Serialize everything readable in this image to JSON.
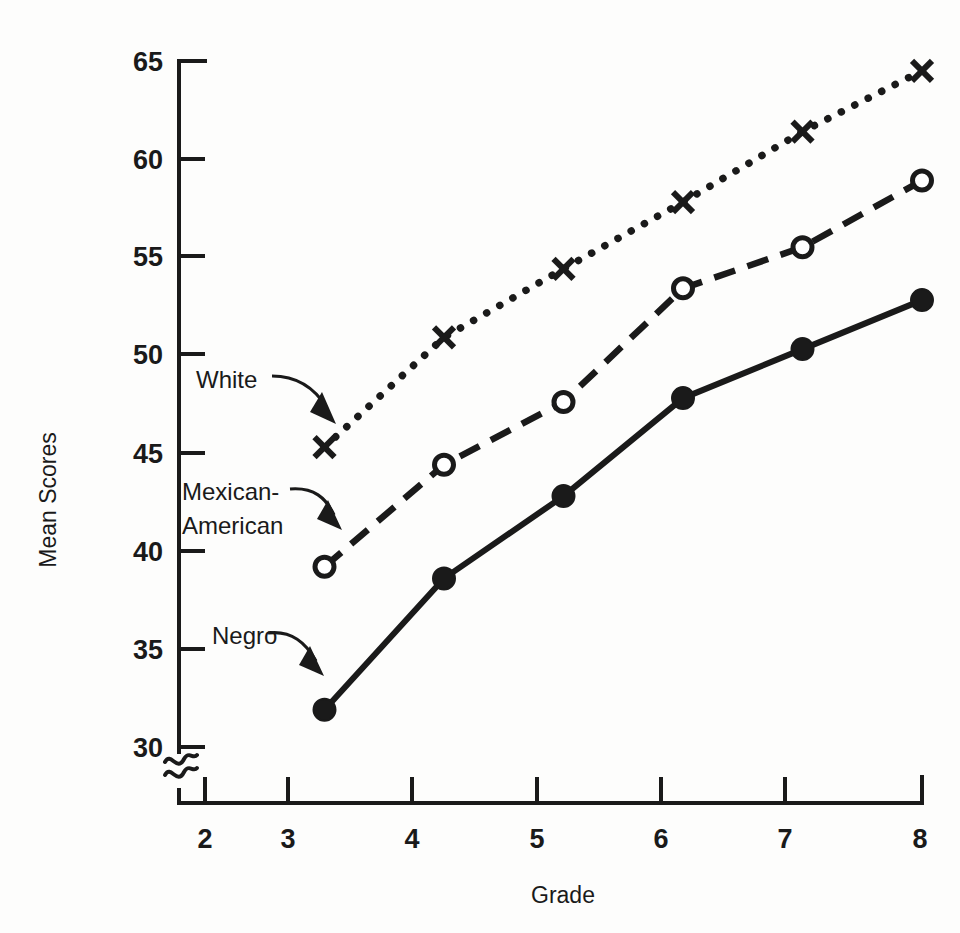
{
  "chart_data": {
    "type": "line",
    "title": "",
    "xlabel": "Grade",
    "ylabel": "Mean Scores",
    "x": [
      3,
      4,
      5,
      6,
      7,
      8
    ],
    "xticks": [
      "2",
      "3",
      "4",
      "5",
      "6",
      "7",
      "8"
    ],
    "xtick_values": [
      2,
      3,
      4,
      5,
      6,
      7,
      8
    ],
    "yticks": [
      "30",
      "35",
      "40",
      "45",
      "50",
      "55",
      "60",
      "65"
    ],
    "ytick_values": [
      30,
      35,
      40,
      45,
      50,
      55,
      60,
      65
    ],
    "xlim": [
      2,
      8
    ],
    "ylim": [
      28.6,
      66
    ],
    "grid": false,
    "legend": "inline-annotations",
    "y_axis_break": true,
    "y_axis_break_symbol": "≈",
    "series": [
      {
        "name": "White",
        "marker": "x-cross",
        "linestyle": "dotted",
        "color": "#1a1a1a",
        "values": [
          45.3,
          50.9,
          54.4,
          57.8,
          61.4,
          64.5
        ]
      },
      {
        "name": "Mexican-American",
        "marker": "open-circle",
        "linestyle": "dashed",
        "color": "#1a1a1a",
        "values": [
          39.2,
          44.4,
          47.6,
          53.4,
          55.5,
          58.9
        ]
      },
      {
        "name": "Negro",
        "marker": "filled-circle",
        "linestyle": "solid",
        "color": "#1a1a1a",
        "values": [
          31.9,
          38.6,
          42.8,
          47.8,
          50.3,
          52.8
        ]
      }
    ],
    "annotations": [
      {
        "text": "White",
        "series": "White",
        "label_x": 196,
        "label_y": 388
      },
      {
        "text": "Mexican-",
        "series": "Mexican-American",
        "label_x": 182,
        "label_y": 500
      },
      {
        "text": "American",
        "series": "Mexican-American",
        "label_x": 182,
        "label_y": 534
      },
      {
        "text": "Negro",
        "series": "Negro",
        "label_x": 212,
        "label_y": 644
      }
    ]
  },
  "labels": {
    "y_axis_title": "Mean Scores",
    "x_axis_title": "Grade",
    "y_ticks": {
      "t65": "65",
      "t60": "60",
      "t55": "55",
      "t50": "50",
      "t45": "45",
      "t40": "40",
      "t35": "35",
      "t30": "30"
    },
    "x_ticks": {
      "t2": "2",
      "t3": "3",
      "t4": "4",
      "t5": "5",
      "t6": "6",
      "t7": "7",
      "t8": "8"
    },
    "annotations": {
      "white": "White",
      "mexican_line1": "Mexican-",
      "mexican_line2": "American",
      "negro": "Negro"
    }
  },
  "style": {
    "ink_color": "#1a1a1a",
    "background": "#fdfdfc"
  }
}
